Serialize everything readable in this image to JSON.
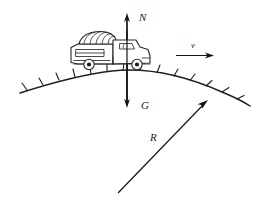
{
  "diagram": {
    "labels": {
      "normal_force": "N",
      "gravity": "G",
      "velocity": "v",
      "radius": "R"
    },
    "colors": {
      "ink": "#1f1f1f",
      "background": "#ffffff"
    },
    "vectors": [
      {
        "name": "normal-force",
        "label": "N",
        "direction": "up",
        "from": [
          127,
          105
        ],
        "to": [
          127,
          14
        ]
      },
      {
        "name": "gravity",
        "label": "G",
        "direction": "down",
        "from": [
          127,
          14
        ],
        "to": [
          127,
          107
        ]
      },
      {
        "name": "velocity",
        "label": "v",
        "direction": "right",
        "from": [
          176,
          55
        ],
        "to": [
          214,
          55
        ]
      },
      {
        "name": "radius",
        "label": "R",
        "direction": "up-right",
        "from": [
          118,
          193
        ],
        "to": [
          208,
          100
        ]
      }
    ],
    "road": {
      "name": "convex-road-arc",
      "shape": "convex arc (hill crest)",
      "hatch_marks": 13,
      "hatch_side": "outer"
    },
    "vehicle": {
      "name": "truck",
      "orientation": "facing right",
      "wheels": 2,
      "parts": [
        "cargo-box",
        "hatched-roof",
        "cab",
        "cab-window",
        "front-wheel",
        "rear-wheel"
      ]
    }
  }
}
